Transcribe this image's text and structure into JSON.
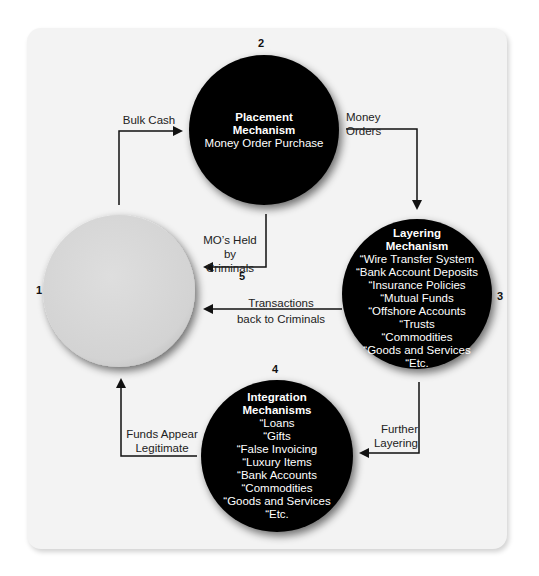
{
  "nodes": {
    "start": {
      "number": "1",
      "fill": "#d8d8d8"
    },
    "placement": {
      "number": "2",
      "title_line1": "Placement",
      "title_line2": "Mechanism",
      "subtitle": "Money Order Purchase",
      "fill": "#000000"
    },
    "layering": {
      "number": "3",
      "title_line1": "Layering",
      "title_line2": "Mechanism",
      "items": [
        "“Wire Transfer System",
        "“Bank Account Deposits",
        "“Insurance Policies",
        "“Mutual Funds",
        "“Offshore Accounts",
        "“Trusts",
        "“Commodities",
        "“Goods and Services",
        "“Etc."
      ],
      "fill": "#000000"
    },
    "integration": {
      "number": "4",
      "title_line1": "Integration",
      "title_line2": "Mechanisms",
      "items": [
        "“Loans",
        "“Gifts",
        "“False Invoicing",
        "“Luxury Items",
        "“Bank Accounts",
        "“Commodities",
        "“Goods and Services",
        "“Etc."
      ],
      "fill": "#000000"
    }
  },
  "edges": {
    "bulk_cash": "Bulk Cash",
    "money_orders": "Money Orders",
    "mo_held_line1": "MO’s Held by",
    "mo_held_line2": "Criminals",
    "mo_held_number": "5",
    "transactions_line1": "Transactions",
    "transactions_line2": "back to Criminals",
    "further_line1": "Further",
    "further_line2": "Layering",
    "funds_line1": "Funds Appear",
    "funds_line2": "Legitimate"
  },
  "colors": {
    "panel": "#f3f3f3",
    "line": "#111111"
  }
}
